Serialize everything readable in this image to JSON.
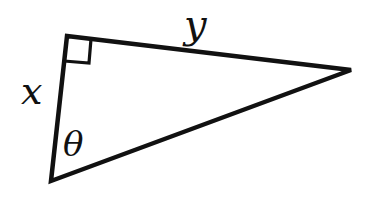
{
  "figure": {
    "type": "right-triangle",
    "colors": {
      "stroke": "#111111",
      "background": "#ffffff"
    },
    "vertices": {
      "right_angle": [
        67,
        36
      ],
      "far": [
        351,
        70
      ],
      "bottom": [
        51,
        181
      ]
    },
    "labels": {
      "leg_vertical": "x",
      "leg_top": "y",
      "angle": "θ"
    },
    "right_angle_marker": true
  }
}
